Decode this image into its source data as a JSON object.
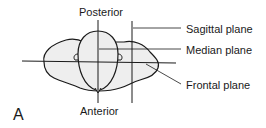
{
  "diagram": {
    "panel_label": "A",
    "orientation": {
      "top": "Posterior",
      "bottom": "Anterior"
    },
    "planes": [
      {
        "label": "Sagittal plane"
      },
      {
        "label": "Median plane"
      },
      {
        "label": "Frontal plane"
      }
    ],
    "colors": {
      "fill": "#eeeeee",
      "stroke": "#1a1a1a",
      "background": "#ffffff"
    }
  }
}
